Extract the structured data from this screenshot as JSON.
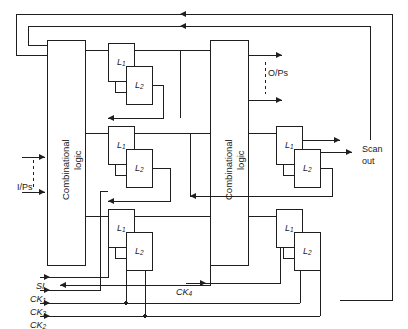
{
  "figure": {
    "type": "logic-circuit-block-diagram",
    "stroke_color": "#1f1f1f",
    "background": "#ffffff"
  },
  "blocks": {
    "combinational_left": {
      "line1": "Combinational",
      "line2": "logic"
    },
    "combinational_right": {
      "line1": "Combinational",
      "line2": "logic"
    }
  },
  "latch_pairs": [
    {
      "id": "pair-left-top",
      "master": "L",
      "master_sub": "1",
      "slave": "L",
      "slave_sub": "2"
    },
    {
      "id": "pair-left-mid",
      "master": "L",
      "master_sub": "1",
      "slave": "L",
      "slave_sub": "2"
    },
    {
      "id": "pair-left-bottom",
      "master": "L",
      "master_sub": "1",
      "slave": "L",
      "slave_sub": "2"
    },
    {
      "id": "pair-right-mid",
      "master": "L",
      "master_sub": "1",
      "slave": "L",
      "slave_sub": "2"
    },
    {
      "id": "pair-right-bottom",
      "master": "L",
      "master_sub": "1",
      "slave": "L",
      "slave_sub": "2"
    }
  ],
  "ports": {
    "inputs_label": "I/Ps",
    "outputs_label": "O/Ps",
    "scan_out_line1": "Scan",
    "scan_out_line2": "out"
  },
  "signals": [
    {
      "name": "SI",
      "base": "SI",
      "sub": ""
    },
    {
      "name": "CK1",
      "base": "CK",
      "sub": "1"
    },
    {
      "name": "CK3",
      "base": "CK",
      "sub": "3"
    },
    {
      "name": "CK2",
      "base": "CK",
      "sub": "2"
    }
  ],
  "internal_signals": [
    {
      "name": "CK4",
      "base": "CK",
      "sub": "4"
    }
  ]
}
